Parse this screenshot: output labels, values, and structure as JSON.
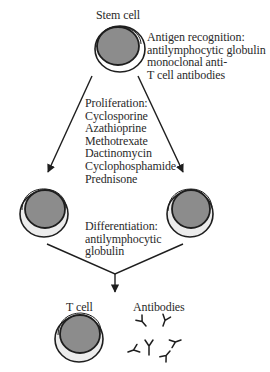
{
  "labels": {
    "stem_cell": "Stem cell",
    "t_cell": "T cell",
    "antibodies": "Antibodies"
  },
  "antigen_recognition": {
    "title": "Antigen recognition:",
    "lines": [
      "antilymphocytic globulin",
      "monoclonal anti-",
      "T cell antibodies"
    ]
  },
  "proliferation": {
    "title": "Proliferation:",
    "drugs": [
      "Cyclosporine",
      "Azathioprine",
      "Methotrexate",
      "Dactinomycin",
      "Cyclophosphamide",
      "Prednisone"
    ]
  },
  "differentiation": {
    "title": "Differentiation:",
    "lines": [
      "antilymphocytic",
      "globulin"
    ]
  },
  "colors": {
    "outline": "#1e1e1e",
    "nucleus": "#8c8c8c",
    "cytoplasm": "#ececec",
    "text": "#2a2a2a"
  }
}
